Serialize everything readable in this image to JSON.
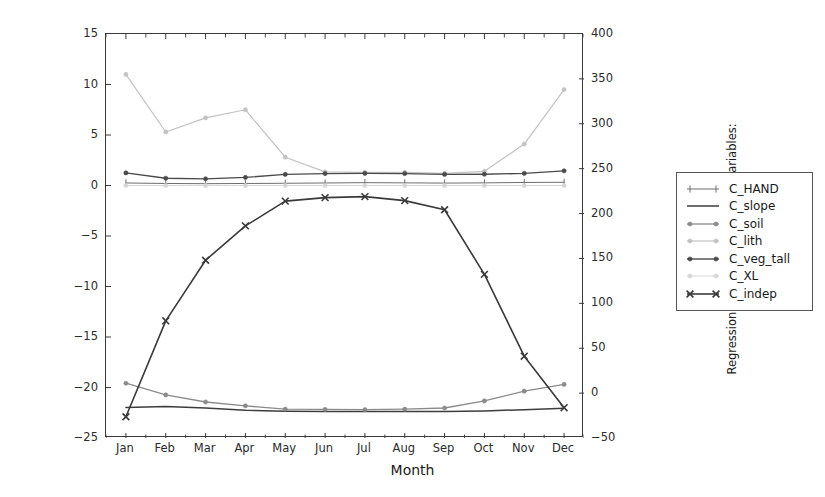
{
  "chart_data": {
    "type": "line",
    "title": "",
    "xlabel": "Month",
    "ylabel_left": "Regression coefficients [-] for the variables:\nHAND, lith, veg_tall, XL, and independent term",
    "ylabel_right": "Regression coefficients [-] for the variables:\nslope and soil",
    "categories": [
      "Jan",
      "Feb",
      "Mar",
      "Apr",
      "May",
      "Jun",
      "Jul",
      "Aug",
      "Sep",
      "Oct",
      "Nov",
      "Dec"
    ],
    "ylim_left": [
      -25,
      15
    ],
    "ylim_right": [
      -50,
      400
    ],
    "yticks_left": [
      15,
      10,
      5,
      0,
      -5,
      -10,
      -15,
      -20,
      -25
    ],
    "yticks_right": [
      400,
      350,
      300,
      250,
      200,
      150,
      100,
      50,
      0,
      -50
    ],
    "grid": false,
    "legend_position": "outside-right",
    "series": [
      {
        "name": "C_HAND",
        "axis": "left",
        "color": "#6e6e6e",
        "marker": "plus",
        "linewidth": 1.0,
        "values": [
          0.25,
          0.2,
          0.18,
          0.2,
          0.22,
          0.25,
          0.28,
          0.26,
          0.24,
          0.26,
          0.3,
          0.32
        ]
      },
      {
        "name": "C_slope",
        "axis": "right",
        "color": "#3d3d3d",
        "marker": "none",
        "linewidth": 1.5,
        "values": [
          -16.0,
          -15.0,
          -16.6,
          -19.2,
          -20.1,
          -20.4,
          -20.6,
          -20.6,
          -20.5,
          -19.8,
          -18.4,
          -16.9
        ]
      },
      {
        "name": "C_soil",
        "axis": "right",
        "color": "#8a8a8a",
        "marker": "dot",
        "linewidth": 1.3,
        "values": [
          11.0,
          -2.0,
          -9.9,
          -14.2,
          -17.9,
          -18.2,
          -18.5,
          -17.9,
          -16.6,
          -8.7,
          2.2,
          9.7
        ]
      },
      {
        "name": "C_lith",
        "axis": "left",
        "color": "#c2c2c2",
        "marker": "dot",
        "linewidth": 1.2,
        "values": [
          11.0,
          5.3,
          6.7,
          7.5,
          2.8,
          1.35,
          1.3,
          1.3,
          1.2,
          1.4,
          4.1,
          9.5
        ]
      },
      {
        "name": "C_veg_tall",
        "axis": "left",
        "color": "#4a4a4a",
        "marker": "dot",
        "linewidth": 1.4,
        "values": [
          1.25,
          0.72,
          0.66,
          0.8,
          1.1,
          1.18,
          1.2,
          1.18,
          1.1,
          1.12,
          1.2,
          1.45
        ]
      },
      {
        "name": "C_XL",
        "axis": "left",
        "color": "#d6d6d6",
        "marker": "dot",
        "linewidth": 1.0,
        "values": [
          0.0,
          0.0,
          0.0,
          0.0,
          0.0,
          0.0,
          0.0,
          0.0,
          0.0,
          0.0,
          0.0,
          0.0
        ]
      },
      {
        "name": "C_indep",
        "axis": "left",
        "color": "#3a3a3a",
        "marker": "x",
        "linewidth": 1.6,
        "values": [
          -22.9,
          -13.4,
          -7.4,
          -4.0,
          -1.55,
          -1.2,
          -1.1,
          -1.5,
          -2.4,
          -8.8,
          -16.9,
          -22.0
        ]
      }
    ]
  },
  "legend": {
    "items": [
      {
        "label": "C_HAND"
      },
      {
        "label": "C_slope"
      },
      {
        "label": "C_soil"
      },
      {
        "label": "C_lith"
      },
      {
        "label": "C_veg_tall"
      },
      {
        "label": "C_XL"
      },
      {
        "label": "C_indep"
      }
    ]
  }
}
